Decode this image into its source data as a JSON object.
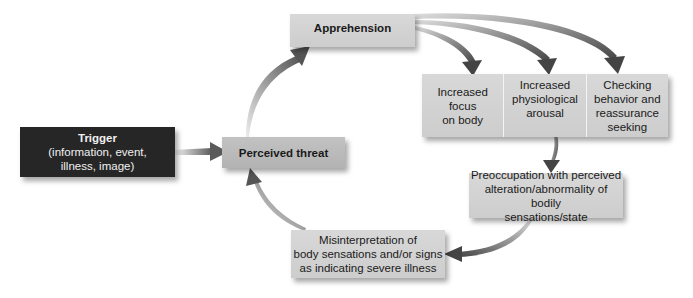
{
  "diagram": {
    "nodes": {
      "trigger": {
        "title": "Trigger",
        "subtitle": "(information, event,\nillness,  image)"
      },
      "perceived_threat": {
        "label": "Perceived threat"
      },
      "apprehension": {
        "label": "Apprehension"
      },
      "increased_focus": {
        "label": "Increased focus\non body"
      },
      "physiological_arousal": {
        "label": "Increased\nphysiological\narousal"
      },
      "checking_behavior": {
        "label": "Checking\nbehavior and\nreassurance\nseeking"
      },
      "preoccupation": {
        "label": "Preoccupation with perceived\nalteration/abnormality of bodily\nsensations/state"
      },
      "misinterpretation": {
        "label": "Misinterpretation of\nbody sensations and/or signs\nas indicating severe illness"
      }
    },
    "edges": [
      {
        "from": "trigger",
        "to": "perceived_threat"
      },
      {
        "from": "perceived_threat",
        "to": "apprehension"
      },
      {
        "from": "apprehension",
        "to": "increased_focus"
      },
      {
        "from": "apprehension",
        "to": "physiological_arousal"
      },
      {
        "from": "apprehension",
        "to": "checking_behavior"
      },
      {
        "from": "physiological_arousal",
        "to": "preoccupation"
      },
      {
        "from": "preoccupation",
        "to": "misinterpretation"
      },
      {
        "from": "misinterpretation",
        "to": "perceived_threat"
      }
    ],
    "colors": {
      "trigger_fill": "#262626",
      "node_fill": "#d3d3d3",
      "threat_fill": "#bababa",
      "arrow": "#555555"
    }
  }
}
